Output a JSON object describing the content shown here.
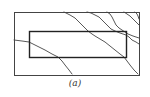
{
  "figure": {
    "caption": "(a)",
    "colors": {
      "stroke": "#444444",
      "inner_stroke": "#222222",
      "background": "#ffffff"
    },
    "outer_rect": {
      "x": 14,
      "y": 12,
      "width": 125,
      "height": 63
    },
    "inner_rect": {
      "x": 29,
      "y": 31,
      "width": 97,
      "height": 26
    },
    "curves": [
      {
        "id": "curve-1",
        "points": "14,40 22,41 29,42 37,46 45,50 52,54 58,57 62,61 65,65 69,70 72,74"
      },
      {
        "id": "curve-2",
        "points": "64,12 70,15 75,18 79,22 82,25 85,28 88,31 92,34 95,36 100,39 105,42 110,46 115,50 120,54 124,57 127,61 130,65 134,70 138,74"
      },
      {
        "id": "curve-3",
        "points": "87,12 91,13 95,15 99,17 102,20 105,23 108,26 111,29 115,31 120,33 126,35 129,37 132,40 136,42 139,44"
      },
      {
        "id": "curve-4",
        "points": "107,12 110,14 112,17 114,21 116,25 119,28 122,30 125,32 128,34 133,36 139,38"
      },
      {
        "id": "curve-5",
        "points": "124,12 127,14 130,16 132,18 134,20 137,23 139,25"
      },
      {
        "id": "curve-6",
        "points": "135,12 137,14 138,16 139,19"
      }
    ]
  }
}
